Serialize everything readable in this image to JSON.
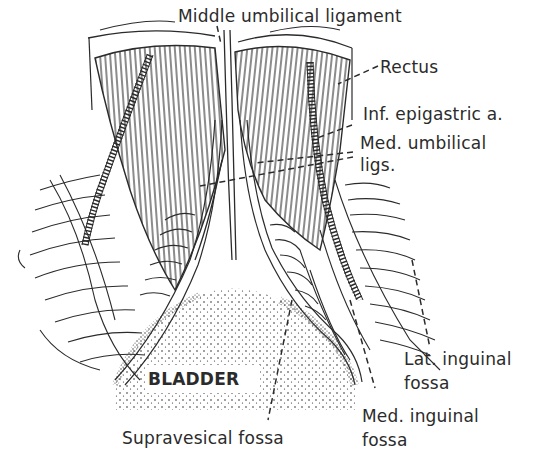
{
  "figure": {
    "ink_color": "#2b2b2b",
    "background": "#ffffff"
  },
  "labels": {
    "middle_umbilical": "Middle umbilical ligament",
    "rectus": "Rectus",
    "inf_epigastric": "Inf. epigastric a.",
    "med_umbilical_line1": "Med. umbilical",
    "med_umbilical_line2": "ligs.",
    "bladder": "BLADDER",
    "lat_inguinal_line1": "Lat. inguinal",
    "lat_inguinal_line2": "fossa",
    "med_inguinal_line1": "Med. inguinal",
    "med_inguinal_line2": "fossa",
    "supravesical": "Supravesical fossa"
  }
}
